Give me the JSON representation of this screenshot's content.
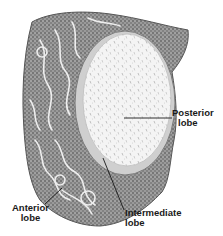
{
  "figure": {
    "colors": {
      "background": "#ffffff",
      "tissue_dark": "#5a5a5a",
      "tissue_mid": "#8c8c8c",
      "tissue_light": "#e6e6e6",
      "posterior_fill": "#f2f2f2",
      "label_text": "#1a1a1a",
      "leader_line": "#1a1a1a"
    }
  },
  "labels": {
    "posterior": {
      "line1": "Posterior",
      "line2": "lobe"
    },
    "anterior": {
      "line1": "Anterior",
      "line2": "lobe"
    },
    "intermediate": {
      "line1": "Intermediate",
      "line2": "lobe"
    }
  }
}
